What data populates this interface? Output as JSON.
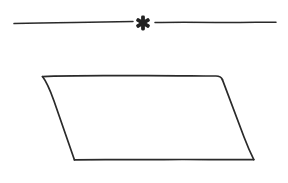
{
  "page": {
    "width": 288,
    "height": 183,
    "background_color": "#ffffff",
    "ink_color": "#2a2a2a",
    "description": "Scanned book page fragment: a section-divider ornament above a hand-drawn parallelogram figure"
  },
  "divider": {
    "name": "section-divider-ornament",
    "ornament_glyph": "*",
    "ornament_icon_name": "asterisk-ornament-icon",
    "ornament_center_x": 143,
    "ornament_center_y": 23,
    "ornament_points": 6,
    "baseline_y": 22,
    "left_rule": {
      "x_start": 14,
      "x_end": 133,
      "y_start": 23.5,
      "y_end": 21.5
    },
    "right_rule": {
      "x_start": 155,
      "x_end": 276,
      "y_start": 22.5,
      "y_end": 22.0
    },
    "stroke_width": 1.5
  },
  "figure": {
    "name": "parallelogram-figure",
    "shape_type": "parallelogram",
    "stroke_width": 1.7,
    "fill_color": "#ffffff",
    "vertices": [
      {
        "label": "top-left",
        "x": 42,
        "y": 76
      },
      {
        "label": "top-right",
        "x": 222,
        "y": 76
      },
      {
        "label": "bottom-right",
        "x": 254,
        "y": 160
      },
      {
        "label": "bottom-left",
        "x": 74,
        "y": 160
      }
    ],
    "edges": [
      {
        "label": "top-edge",
        "from": "top-left",
        "to": "top-right"
      },
      {
        "label": "right-edge",
        "from": "top-right",
        "to": "bottom-right"
      },
      {
        "label": "bottom-edge",
        "from": "bottom-right",
        "to": "bottom-left"
      },
      {
        "label": "left-edge",
        "from": "bottom-left",
        "to": "top-left"
      }
    ],
    "width_top": 180,
    "height": 84,
    "horizontal_offset": 32
  }
}
